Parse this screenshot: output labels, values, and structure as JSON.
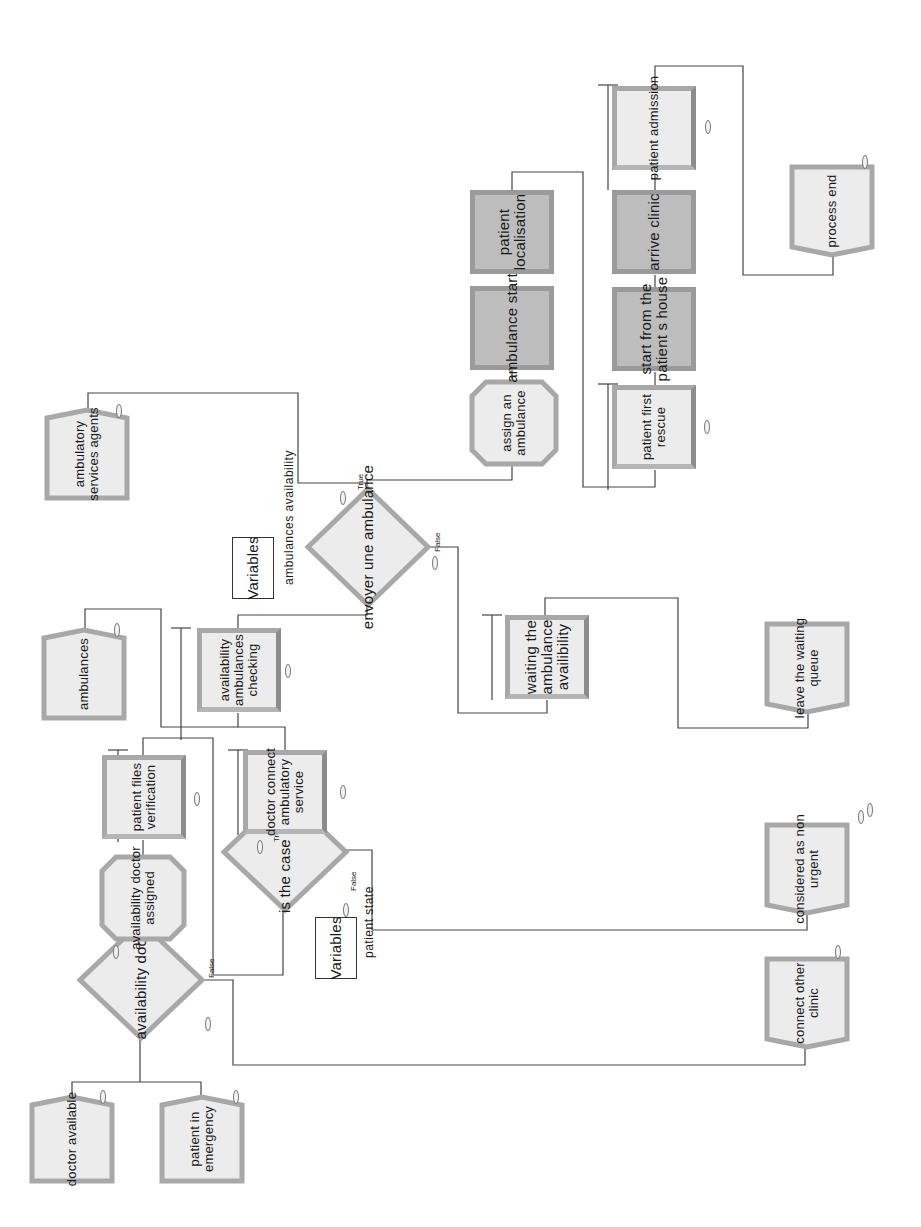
{
  "diagram": {
    "orientation": "rotated-90-ccw",
    "create_modules": [
      {
        "id": "doctor_available",
        "label": "doctor available"
      },
      {
        "id": "patient_in_emergency",
        "label": "patient in\nemergency"
      },
      {
        "id": "ambulances",
        "label": "ambulances"
      },
      {
        "id": "ambulatory_services_agents",
        "label": "ambulatory\nservices agents"
      }
    ],
    "decisions": [
      {
        "id": "availability_doctor",
        "label": "availability doctor",
        "true_label": "True",
        "false_label": "False"
      },
      {
        "id": "is_the_case_urgent",
        "label": "is the case urgent",
        "true_label": "True",
        "false_label": "False"
      },
      {
        "id": "envoyer_une_ambulance",
        "label": "envoyer une ambulance",
        "true_label": "True",
        "false_label": "False"
      }
    ],
    "processes": [
      {
        "id": "availability_doctor_assigned",
        "label": "availability doctor\nassigned",
        "shape": "octagon"
      },
      {
        "id": "patient_files_verification",
        "label": "patient files\nverification"
      },
      {
        "id": "doctor_connect_ambulatory_service",
        "label": "doctor connect\nambulatory\nservice"
      },
      {
        "id": "availability_ambulances_checking",
        "label": "availability\nambulances\nchecking"
      },
      {
        "id": "waiting_the_ambulance_availability",
        "label": "waiting the\nambulance\navailibility"
      },
      {
        "id": "assign_an_ambulance",
        "label": "assign an\nambulance",
        "shape": "octagon"
      },
      {
        "id": "ambulance_start",
        "label": "ambulance start",
        "style": "dark"
      },
      {
        "id": "patient_localisation",
        "label": "patient\nlocalisation",
        "style": "dark"
      },
      {
        "id": "patient_first_rescue",
        "label": "patient first\nrescue"
      },
      {
        "id": "start_from_the_patients_house",
        "label": "start from the\npatient s house",
        "style": "dark"
      },
      {
        "id": "arrive_clinic",
        "label": "arrive clinic",
        "style": "dark"
      },
      {
        "id": "patient_admission",
        "label": "patient admission"
      }
    ],
    "dispose_modules": [
      {
        "id": "leave_the_waiting_queue",
        "label": "leave the waiting\nqueue"
      },
      {
        "id": "process_end",
        "label": "process end"
      },
      {
        "id": "considered_as_non_urgent",
        "label": "considered as non\nurgent"
      },
      {
        "id": "connect_other_clinic",
        "label": "connect other\nclinic"
      }
    ],
    "variables": [
      {
        "id": "var_ambulances",
        "box_label": "Variables",
        "text": "ambulances availability"
      },
      {
        "id": "var_patient",
        "box_label": "Variables",
        "text": "patient state"
      }
    ],
    "counter_value": "0",
    "colors": {
      "light_fill": "#ececec",
      "dark_fill": "#bdbdbd",
      "border": "#a8a8a8",
      "line": "#444444"
    }
  }
}
